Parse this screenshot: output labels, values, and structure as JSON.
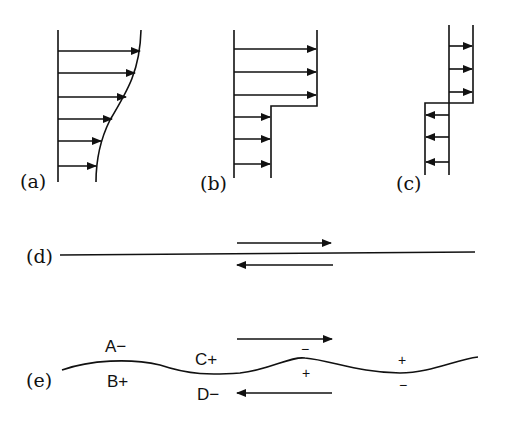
{
  "panels": {
    "a": {
      "label": "(a)",
      "description": "smooth velocity profile"
    },
    "b": {
      "label": "(b)",
      "description": "step velocity profile"
    },
    "c": {
      "label": "(c)",
      "description": "opposing step velocity profile"
    },
    "d": {
      "label": "(d)",
      "description": "vortex sheet with opposite flows"
    },
    "e": {
      "label": "(e)",
      "description": "perturbed vortex sheet",
      "annotations": {
        "A": "A−",
        "B": "B+",
        "C": "C+",
        "D": "D−",
        "crest1_top": "−",
        "crest1_bottom": "+",
        "trough2_top": "+",
        "trough2_bottom": "−"
      }
    }
  },
  "colors": {
    "ink": "#111111",
    "background": "#ffffff"
  }
}
